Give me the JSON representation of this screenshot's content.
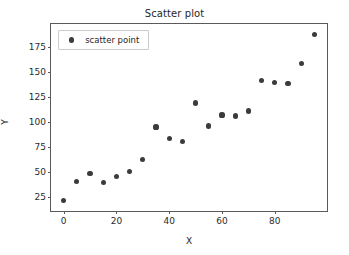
{
  "chart_data": {
    "type": "scatter",
    "title": "Scatter plot",
    "xlabel": "X",
    "ylabel": "Y",
    "legend": [
      {
        "name": "scatter point",
        "marker": "circle",
        "color": "#3b3b3b"
      }
    ],
    "legend_position": "upper left",
    "grid": false,
    "xlim": [
      -4.8,
      99.8
    ],
    "ylim": [
      11.5,
      197.5
    ],
    "xticks": [
      0,
      20,
      40,
      60,
      80
    ],
    "yticks": [
      25,
      50,
      75,
      100,
      125,
      150,
      175
    ],
    "xticklabels": [
      "0",
      "20",
      "40",
      "60",
      "80"
    ],
    "yticklabels": [
      "25",
      "50",
      "75",
      "100",
      "125",
      "150",
      "175"
    ],
    "series": [
      {
        "name": "scatter point",
        "color": "#3b3b3b",
        "x": [
          0,
          5,
          10,
          15,
          20,
          25,
          30,
          35,
          40,
          45,
          50,
          55,
          60,
          65,
          70,
          75,
          80,
          85,
          90,
          95
        ],
        "y": [
          22,
          41,
          49,
          40,
          46,
          51,
          63,
          95,
          84,
          81,
          119,
          96,
          107,
          106,
          111,
          141,
          139,
          138,
          158,
          187
        ]
      }
    ]
  },
  "style": {
    "background": "#ffffff",
    "axis_color": "#5a5a5a",
    "text_color": "#262626",
    "point_color": "#3b3b3b",
    "legend_border": "#cccccc"
  }
}
